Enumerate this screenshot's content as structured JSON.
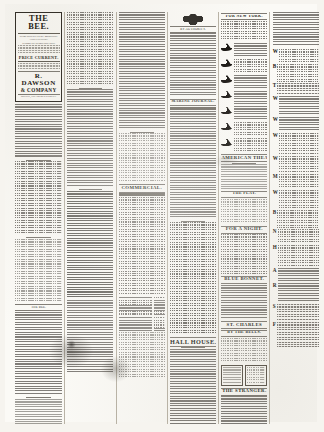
{
  "document": {
    "type": "newspaper-page",
    "orientation": "portrait",
    "column_count": 6,
    "paper_tone": "#fbfaf6",
    "ink_tone": "#15120e"
  },
  "masthead": {
    "title": "THE BEE.",
    "subtitle_lines": [
      "PUBLISHED EVERY MORNING AND EVENING.",
      "TERMS OF SUBSCRIPTION."
    ],
    "mid_line": "PRICE CURRENT.",
    "publisher_name": "R. DAWSON",
    "publisher_name2": "& COMPANY",
    "footer_line": "OFFICE, CHARTRES STREET."
  },
  "columns": [
    {
      "index": 1,
      "name": "column-leader-editorial",
      "blocks": [
        {
          "kind": "masthead"
        },
        {
          "kind": "text",
          "lines": 22,
          "weight": "normal"
        },
        {
          "kind": "rule",
          "style": "short"
        },
        {
          "kind": "text",
          "lines": 30,
          "weight": "normal"
        },
        {
          "kind": "rule",
          "style": "short"
        },
        {
          "kind": "text",
          "lines": 26,
          "weight": "light"
        },
        {
          "kind": "heading",
          "size": "tiny",
          "label": "THE BEE."
        },
        {
          "kind": "text",
          "lines": 34,
          "weight": "normal"
        },
        {
          "kind": "rule",
          "style": "short"
        },
        {
          "kind": "text",
          "lines": 30,
          "weight": "light"
        }
      ]
    },
    {
      "index": 2,
      "name": "column-news",
      "blocks": [
        {
          "kind": "text",
          "lines": 30,
          "weight": "normal"
        },
        {
          "kind": "rule",
          "style": "short"
        },
        {
          "kind": "text",
          "lines": 40,
          "weight": "normal"
        },
        {
          "kind": "rule",
          "style": "short"
        },
        {
          "kind": "text",
          "lines": 44,
          "weight": "dark"
        },
        {
          "kind": "text",
          "lines": 30,
          "weight": "normal"
        }
      ]
    },
    {
      "index": 3,
      "name": "column-commercial",
      "blocks": [
        {
          "kind": "text",
          "lines": 48,
          "weight": "normal"
        },
        {
          "kind": "rule",
          "style": "short"
        },
        {
          "kind": "text",
          "lines": 20,
          "weight": "light"
        },
        {
          "kind": "heading",
          "size": "mid",
          "label": "COMMERCIAL."
        },
        {
          "kind": "rule",
          "style": "double"
        },
        {
          "kind": "text",
          "lines": 40,
          "weight": "normal"
        },
        {
          "kind": "table",
          "rows": 12
        },
        {
          "kind": "text",
          "lines": 18,
          "weight": "light"
        }
      ]
    },
    {
      "index": 4,
      "name": "column-official-notices",
      "blocks": [
        {
          "kind": "crest",
          "label": "royal-arms-crest"
        },
        {
          "kind": "heading",
          "size": "tiny",
          "label": "BY AUTHORITY."
        },
        {
          "kind": "text",
          "lines": 26,
          "weight": "normal"
        },
        {
          "kind": "heading",
          "size": "sm",
          "label": "MARINE JOURNAL."
        },
        {
          "kind": "rule",
          "style": "double"
        },
        {
          "kind": "text",
          "lines": 44,
          "weight": "normal"
        },
        {
          "kind": "rule",
          "style": "short"
        },
        {
          "kind": "text",
          "lines": 46,
          "weight": "dark"
        },
        {
          "kind": "heading",
          "size": "big",
          "label": "HALL HOUSE."
        },
        {
          "kind": "rule",
          "style": "short"
        },
        {
          "kind": "text",
          "lines": 34,
          "weight": "normal"
        },
        {
          "kind": "shipcut-ad",
          "count": 1,
          "lines": 10
        },
        {
          "kind": "text",
          "lines": 30,
          "weight": "normal"
        }
      ]
    },
    {
      "index": 5,
      "name": "column-shipping-amusements",
      "blocks": [
        {
          "kind": "heading",
          "size": "sm",
          "label": "FOR NEW YORK."
        },
        {
          "kind": "text",
          "lines": 8,
          "weight": "normal"
        },
        {
          "kind": "shipcut-ad",
          "count": 7,
          "lines": 6
        },
        {
          "kind": "heading",
          "size": "mid",
          "label": "AMERICAN THEATRE."
        },
        {
          "kind": "rule",
          "style": "short"
        },
        {
          "kind": "text",
          "lines": 10,
          "weight": "light"
        },
        {
          "kind": "heading",
          "size": "sm",
          "label": "THE PLAY."
        },
        {
          "kind": "text",
          "lines": 10,
          "weight": "light"
        },
        {
          "kind": "heading",
          "size": "mid",
          "label": "FOR A NIGHT."
        },
        {
          "kind": "text",
          "lines": 16,
          "weight": "normal"
        },
        {
          "kind": "heading",
          "size": "mid",
          "label": "BLUE BONNET."
        },
        {
          "kind": "text",
          "lines": 14,
          "weight": "normal"
        },
        {
          "kind": "heading",
          "size": "mid",
          "label": "ST. CHARLES"
        },
        {
          "kind": "heading",
          "size": "sm",
          "label": "BY THE BELLS."
        },
        {
          "kind": "text",
          "lines": 10,
          "weight": "light"
        },
        {
          "kind": "playbill-panel"
        },
        {
          "kind": "heading",
          "size": "mid",
          "label": "THE STRANGER."
        },
        {
          "kind": "text",
          "lines": 40,
          "weight": "normal"
        }
      ]
    },
    {
      "index": 6,
      "name": "column-classified-ads",
      "blocks": [
        {
          "kind": "text",
          "lines": 14,
          "weight": "normal"
        },
        {
          "kind": "classified",
          "initial": "W",
          "lines": 6
        },
        {
          "kind": "classified",
          "initial": "B",
          "lines": 7
        },
        {
          "kind": "classified",
          "initial": "T",
          "lines": 5
        },
        {
          "kind": "classified",
          "initial": "W",
          "lines": 8
        },
        {
          "kind": "classified",
          "initial": "W",
          "lines": 6
        },
        {
          "kind": "classified",
          "initial": "W",
          "lines": 9
        },
        {
          "kind": "classified",
          "initial": "W",
          "lines": 7
        },
        {
          "kind": "classified",
          "initial": "M",
          "lines": 6
        },
        {
          "kind": "classified",
          "initial": "W",
          "lines": 8
        },
        {
          "kind": "classified",
          "initial": "B",
          "lines": 7
        },
        {
          "kind": "classified",
          "initial": "N",
          "lines": 6
        },
        {
          "kind": "classified",
          "initial": "H",
          "lines": 9
        },
        {
          "kind": "classified",
          "initial": "A",
          "lines": 6
        },
        {
          "kind": "classified",
          "initial": "R",
          "lines": 8
        },
        {
          "kind": "classified",
          "initial": "S",
          "lines": 7
        },
        {
          "kind": "classified",
          "initial": "F",
          "lines": 10
        }
      ]
    }
  ]
}
